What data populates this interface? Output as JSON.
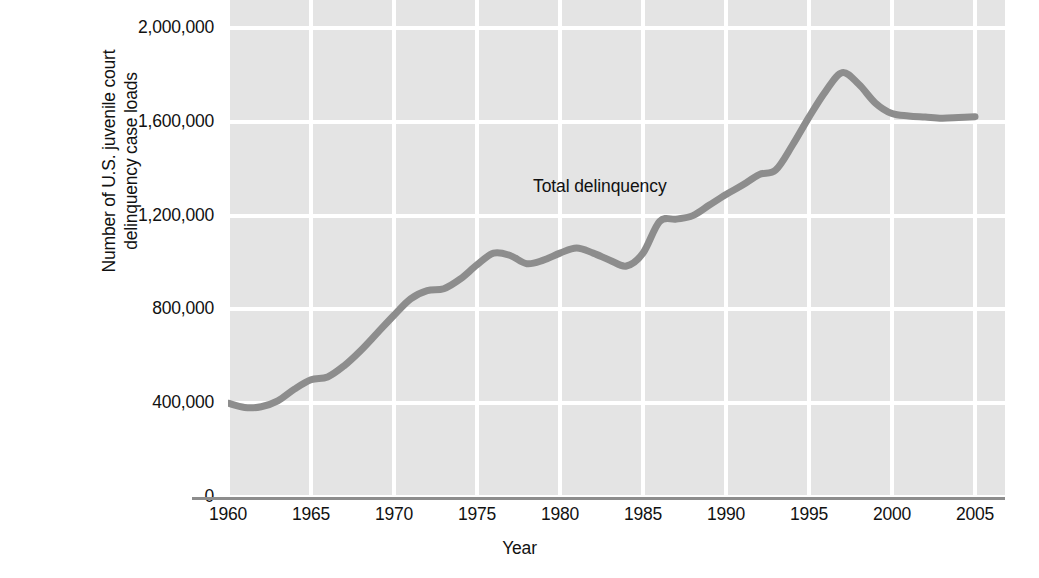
{
  "chart_data": {
    "type": "line",
    "title": "",
    "xlabel": "Year",
    "ylabel": "Number of U.S. juvenile court delinquency case loads",
    "ylabel_lines": [
      "Number of U.S. juvenile court",
      "delinquency case loads"
    ],
    "xlim": [
      1960,
      2005
    ],
    "ylim": [
      0,
      2000000
    ],
    "grid": true,
    "legend": "none",
    "annotations": [
      {
        "text": "Total delinquency",
        "x": 1982,
        "y": 1320000
      }
    ],
    "ytick_labels": [
      "2,000,000",
      "1,600,000",
      "1,200,000",
      "800,000",
      "400,000",
      "0"
    ],
    "yticks": [
      2000000,
      1600000,
      1200000,
      800000,
      400000,
      0
    ],
    "xtick_labels": [
      "1960",
      "1965",
      "1970",
      "1975",
      "1980",
      "1985",
      "1990",
      "1995",
      "2000",
      "2005"
    ],
    "xticks": [
      1960,
      1965,
      1970,
      1975,
      1980,
      1985,
      1990,
      1995,
      2000,
      2005
    ],
    "series": [
      {
        "name": "Total delinquency",
        "color": "#8d8d8d",
        "x": [
          1960,
          1961,
          1962,
          1963,
          1964,
          1965,
          1966,
          1967,
          1968,
          1969,
          1970,
          1971,
          1972,
          1973,
          1974,
          1975,
          1976,
          1977,
          1978,
          1979,
          1980,
          1981,
          1982,
          1983,
          1984,
          1985,
          1986,
          1987,
          1988,
          1989,
          1990,
          1991,
          1992,
          1993,
          1994,
          1995,
          1996,
          1997,
          1998,
          1999,
          2000,
          2001,
          2002,
          2003,
          2004,
          2005
        ],
        "values": [
          400000,
          382000,
          385000,
          410000,
          460000,
          500000,
          512000,
          560000,
          625000,
          700000,
          775000,
          845000,
          880000,
          888000,
          930000,
          990000,
          1040000,
          1030000,
          995000,
          1010000,
          1040000,
          1062000,
          1040000,
          1010000,
          985000,
          1040000,
          1175000,
          1185000,
          1200000,
          1245000,
          1290000,
          1330000,
          1375000,
          1395000,
          1500000,
          1620000,
          1730000,
          1810000,
          1760000,
          1680000,
          1635000,
          1625000,
          1620000,
          1615000,
          1618000,
          1622000
        ]
      }
    ]
  },
  "colors": {
    "plot_background": "#e4e4e4",
    "gridline": "#ffffff",
    "axis_line": "#8d8d8d",
    "series_line": "#8d8d8d",
    "text": "#111111",
    "page_background": "#ffffff"
  }
}
